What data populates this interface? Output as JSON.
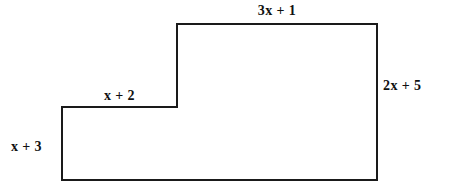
{
  "figure": {
    "background_color": "#ffffff",
    "stroke_color": "#1a1a1a",
    "stroke_width": 2,
    "outline_points": "62,107 177,107 177,24 377,24 377,180 62,180",
    "vertices": [
      {
        "name": "left-step-top-left",
        "x": 62,
        "y": 107
      },
      {
        "name": "left-step-top-right-inner-corner",
        "x": 177,
        "y": 107
      },
      {
        "name": "upper-top-left",
        "x": 177,
        "y": 24
      },
      {
        "name": "upper-top-right",
        "x": 377,
        "y": 24
      },
      {
        "name": "bottom-right",
        "x": 377,
        "y": 180
      },
      {
        "name": "bottom-left",
        "x": 62,
        "y": 180
      }
    ]
  },
  "labels": {
    "top": "3x + 1",
    "right": "2x + 5",
    "step": "x + 2",
    "left": "x + 3"
  }
}
